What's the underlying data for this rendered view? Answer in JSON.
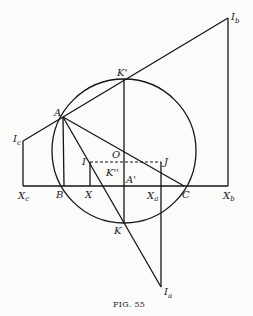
{
  "figure": {
    "caption": "FIG. 55",
    "labels": {
      "Ib": "I",
      "Ib_sub": "b",
      "Kp": "K'",
      "A": "A",
      "Ic": "I",
      "Ic_sub": "c",
      "O": "O",
      "I": "I",
      "J": "J",
      "Kpp": "K''",
      "Ap": "A'",
      "Xc": "X",
      "Xc_sub": "c",
      "B": "B",
      "X": "X",
      "Xa": "X",
      "Xa_sub": "a",
      "C": "C",
      "Xb": "X",
      "Xb_sub": "b",
      "K": "K",
      "Ia": "I",
      "Ia_sub": "a"
    }
  }
}
